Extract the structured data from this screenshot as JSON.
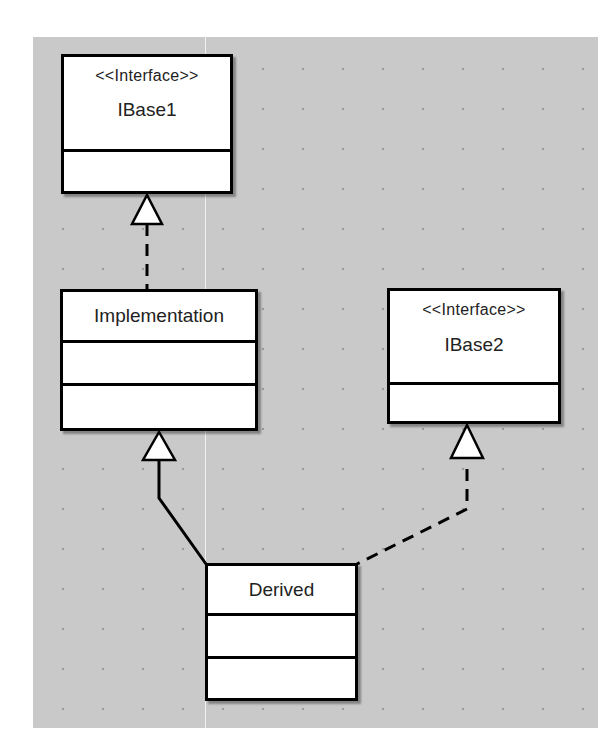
{
  "diagram": {
    "type": "UML class diagram",
    "classes": [
      {
        "id": "ibase1",
        "stereotype": "<<Interface>>",
        "name": "IBase1"
      },
      {
        "id": "implementation",
        "stereotype": "",
        "name": "Implementation"
      },
      {
        "id": "ibase2",
        "stereotype": "<<Interface>>",
        "name": "IBase2"
      },
      {
        "id": "derived",
        "stereotype": "",
        "name": "Derived"
      }
    ],
    "relationships": [
      {
        "from": "Implementation",
        "to": "IBase1",
        "kind": "realization",
        "line": "dashed"
      },
      {
        "from": "Derived",
        "to": "Implementation",
        "kind": "generalization",
        "line": "solid"
      },
      {
        "from": "Derived",
        "to": "IBase2",
        "kind": "realization",
        "line": "dashed"
      }
    ]
  }
}
